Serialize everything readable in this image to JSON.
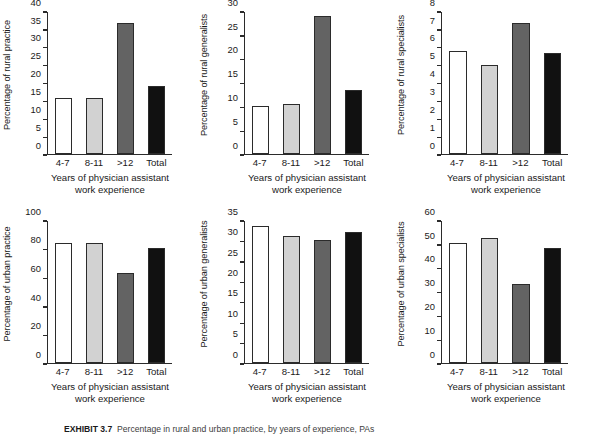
{
  "figure": {
    "background": "#ffffff",
    "caption_prefix": "EXHIBIT 3.7",
    "caption_text": "Percentage in rural and urban practice, by years of experience, PAs"
  },
  "shared": {
    "categories": [
      "4-7",
      "8-11",
      ">12",
      "Total"
    ],
    "xlabel_line1": "Years of physician assistant",
    "xlabel_line2": "work experience",
    "bar_colors": [
      "#ffffff",
      "#d2d2d2",
      "#636363",
      "#111111"
    ],
    "bar_edge_color": "#2b2b2b",
    "axis_color": "#2b2b2b"
  },
  "chart_data": [
    {
      "type": "bar",
      "id": "rural-practice",
      "title": "",
      "xlabel": "Years of physician assistant work experience",
      "ylabel": "Percentage of rural practice",
      "categories": [
        "4-7",
        "8-11",
        ">12",
        "Total"
      ],
      "values": [
        15.7,
        15.7,
        36.8,
        19.2
      ],
      "ylim": [
        0,
        40
      ],
      "yticks": [
        0,
        5,
        10,
        15,
        20,
        25,
        30,
        35,
        40
      ],
      "grid": false,
      "legend": "none"
    },
    {
      "type": "bar",
      "id": "rural-generalists",
      "title": "",
      "xlabel": "Years of physician assistant work experience",
      "ylabel": "Percentage of rural generalists",
      "categories": [
        "4-7",
        "8-11",
        ">12",
        "Total"
      ],
      "values": [
        10.0,
        10.5,
        29.2,
        13.4
      ],
      "ylim": [
        0,
        30
      ],
      "yticks": [
        0,
        5,
        10,
        15,
        20,
        25,
        30
      ],
      "grid": false,
      "legend": "none"
    },
    {
      "type": "bar",
      "id": "rural-specialists",
      "title": "",
      "xlabel": "Years of physician assistant work experience",
      "ylabel": "Percentage of rural specialists",
      "categories": [
        "4-7",
        "8-11",
        ">12",
        "Total"
      ],
      "values": [
        5.8,
        5.0,
        7.4,
        5.7
      ],
      "ylim": [
        0,
        8
      ],
      "yticks": [
        0,
        1,
        2,
        3,
        4,
        5,
        6,
        7,
        8
      ],
      "grid": false,
      "legend": "none"
    },
    {
      "type": "bar",
      "id": "urban-practice",
      "title": "",
      "xlabel": "Years of physician assistant work experience",
      "ylabel": "Percentage of urban practice",
      "categories": [
        "4-7",
        "8-11",
        ">12",
        "Total"
      ],
      "values": [
        84.3,
        84.3,
        63.2,
        80.8
      ],
      "ylim": [
        0,
        100
      ],
      "yticks": [
        0,
        20,
        40,
        60,
        80,
        100
      ],
      "grid": false,
      "legend": "none"
    },
    {
      "type": "bar",
      "id": "urban-generalists",
      "title": "",
      "xlabel": "Years of physician assistant work experience",
      "ylabel": "Percentage of urban generalists",
      "categories": [
        "4-7",
        "8-11",
        ">12",
        "Total"
      ],
      "values": [
        33.7,
        31.3,
        30.2,
        32.2
      ],
      "ylim": [
        0,
        35
      ],
      "yticks": [
        0,
        5,
        10,
        15,
        20,
        25,
        30,
        35
      ],
      "grid": false,
      "legend": "none"
    },
    {
      "type": "bar",
      "id": "urban-specialists",
      "title": "",
      "xlabel": "Years of physician assistant work experience",
      "ylabel": "Percentage of urban specialists",
      "categories": [
        "4-7",
        "8-11",
        ">12",
        "Total"
      ],
      "values": [
        50.5,
        53.0,
        33.2,
        48.6
      ],
      "ylim": [
        0,
        60
      ],
      "yticks": [
        0,
        10,
        20,
        30,
        40,
        50,
        60
      ],
      "grid": false,
      "legend": "none"
    }
  ]
}
